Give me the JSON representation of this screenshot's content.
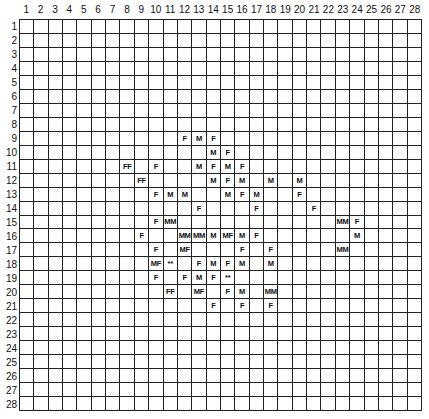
{
  "grid": {
    "columns": 28,
    "rows": 28,
    "column_labels": [
      "1",
      "2",
      "3",
      "4",
      "5",
      "6",
      "7",
      "8",
      "9",
      "10",
      "11",
      "12",
      "13",
      "14",
      "15",
      "16",
      "17",
      "18",
      "19",
      "20",
      "21",
      "22",
      "23",
      "24",
      "25",
      "26",
      "27",
      "28"
    ],
    "row_labels": [
      "1",
      "2",
      "3",
      "4",
      "5",
      "6",
      "7",
      "8",
      "9",
      "10",
      "11",
      "12",
      "13",
      "14",
      "15",
      "16",
      "17",
      "18",
      "19",
      "20",
      "21",
      "22",
      "23",
      "24",
      "25",
      "26",
      "27",
      "28"
    ],
    "cells": [
      {
        "row": 9,
        "col": 12,
        "text": "F"
      },
      {
        "row": 9,
        "col": 13,
        "text": "M"
      },
      {
        "row": 9,
        "col": 14,
        "text": "F"
      },
      {
        "row": 10,
        "col": 14,
        "text": "M"
      },
      {
        "row": 10,
        "col": 15,
        "text": "F"
      },
      {
        "row": 11,
        "col": 8,
        "text": "FF"
      },
      {
        "row": 11,
        "col": 10,
        "text": "F"
      },
      {
        "row": 11,
        "col": 13,
        "text": "M"
      },
      {
        "row": 11,
        "col": 14,
        "text": "F"
      },
      {
        "row": 11,
        "col": 15,
        "text": "M"
      },
      {
        "row": 11,
        "col": 16,
        "text": "F"
      },
      {
        "row": 12,
        "col": 9,
        "text": "FF"
      },
      {
        "row": 12,
        "col": 14,
        "text": "M"
      },
      {
        "row": 12,
        "col": 15,
        "text": "F"
      },
      {
        "row": 12,
        "col": 16,
        "text": "M"
      },
      {
        "row": 12,
        "col": 18,
        "text": "M"
      },
      {
        "row": 12,
        "col": 20,
        "text": "M"
      },
      {
        "row": 13,
        "col": 10,
        "text": "F"
      },
      {
        "row": 13,
        "col": 11,
        "text": "M"
      },
      {
        "row": 13,
        "col": 12,
        "text": "M"
      },
      {
        "row": 13,
        "col": 15,
        "text": "M"
      },
      {
        "row": 13,
        "col": 16,
        "text": "F"
      },
      {
        "row": 13,
        "col": 17,
        "text": "M"
      },
      {
        "row": 13,
        "col": 20,
        "text": "F"
      },
      {
        "row": 14,
        "col": 13,
        "text": "F"
      },
      {
        "row": 14,
        "col": 17,
        "text": "F"
      },
      {
        "row": 14,
        "col": 21,
        "text": "F"
      },
      {
        "row": 15,
        "col": 10,
        "text": "F"
      },
      {
        "row": 15,
        "col": 11,
        "text": "MM"
      },
      {
        "row": 15,
        "col": 23,
        "text": "MM"
      },
      {
        "row": 15,
        "col": 24,
        "text": "F"
      },
      {
        "row": 16,
        "col": 9,
        "text": "F"
      },
      {
        "row": 16,
        "col": 12,
        "text": "MM"
      },
      {
        "row": 16,
        "col": 13,
        "text": "MM"
      },
      {
        "row": 16,
        "col": 14,
        "text": "M"
      },
      {
        "row": 16,
        "col": 15,
        "text": "MF"
      },
      {
        "row": 16,
        "col": 16,
        "text": "M"
      },
      {
        "row": 16,
        "col": 17,
        "text": "F"
      },
      {
        "row": 16,
        "col": 24,
        "text": "M"
      },
      {
        "row": 17,
        "col": 10,
        "text": "F"
      },
      {
        "row": 17,
        "col": 12,
        "text": "MF"
      },
      {
        "row": 17,
        "col": 16,
        "text": "F"
      },
      {
        "row": 17,
        "col": 18,
        "text": "F"
      },
      {
        "row": 17,
        "col": 23,
        "text": "MM"
      },
      {
        "row": 18,
        "col": 10,
        "text": "MF"
      },
      {
        "row": 18,
        "col": 11,
        "text": "**"
      },
      {
        "row": 18,
        "col": 13,
        "text": "F"
      },
      {
        "row": 18,
        "col": 14,
        "text": "M"
      },
      {
        "row": 18,
        "col": 15,
        "text": "F"
      },
      {
        "row": 18,
        "col": 16,
        "text": "M"
      },
      {
        "row": 18,
        "col": 18,
        "text": "M"
      },
      {
        "row": 19,
        "col": 10,
        "text": "F"
      },
      {
        "row": 19,
        "col": 12,
        "text": "F"
      },
      {
        "row": 19,
        "col": 13,
        "text": "M"
      },
      {
        "row": 19,
        "col": 14,
        "text": "F"
      },
      {
        "row": 19,
        "col": 15,
        "text": "**"
      },
      {
        "row": 20,
        "col": 11,
        "text": "FF"
      },
      {
        "row": 20,
        "col": 13,
        "text": "MF"
      },
      {
        "row": 20,
        "col": 15,
        "text": "F"
      },
      {
        "row": 20,
        "col": 16,
        "text": "M"
      },
      {
        "row": 20,
        "col": 18,
        "text": "MM"
      },
      {
        "row": 21,
        "col": 14,
        "text": "F"
      },
      {
        "row": 21,
        "col": 16,
        "text": "F"
      },
      {
        "row": 21,
        "col": 18,
        "text": "F"
      }
    ]
  }
}
